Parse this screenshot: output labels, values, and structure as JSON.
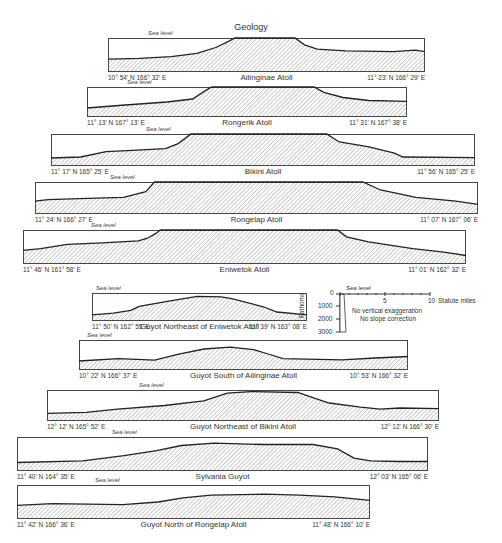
{
  "title": "Geology",
  "sea_level_label": "Sea level",
  "profiles": [
    {
      "name": "Ailinginae Atoll",
      "start": "10° 54' N 166° 32' E",
      "end": "11° 23' N 166° 29' E"
    },
    {
      "name": "Rongerik Atoll",
      "start": "11° 13' N 167° 13' E",
      "end": "11° 31' N 167° 38' E"
    },
    {
      "name": "Bikini Atoll",
      "start": "11° 17' N 165° 25' E",
      "end": "11° 56' N 165° 25' E"
    },
    {
      "name": "Rongelap Atoll",
      "start": "11° 24' N 166° 27' E",
      "end": "11° 07' N 167° 06' E"
    },
    {
      "name": "Eniwetok Atoll",
      "start": "11° 46' N 161° 58' E",
      "end": "11° 01' N 162° 32' E"
    },
    {
      "name": "Guyot Northeast of Eniwetok Atoll",
      "start": "11° 50' N 162° 55' E",
      "end": "11° 39' N 163° 08' E"
    },
    {
      "name": "Guyot South of Ailinginae Atoll",
      "start": "10° 22' N 166° 37' E",
      "end": "10° 53' N 166° 32' E"
    },
    {
      "name": "Guyot Northeast of Bikini Atoll",
      "start": "12° 12' N 165° 52' E",
      "end": "12° 12' N 166° 30' E"
    },
    {
      "name": "Sylvania Guyot",
      "start": "11° 40' N 164° 35' E",
      "end": "12° 03' N 165° 06' E"
    },
    {
      "name": "Guyot North of Rongelap Atoll",
      "start": "11° 42' N 166° 36' E",
      "end": "11° 48' N 166° 10' E"
    }
  ],
  "legend": {
    "depth_axis_label": "Fathoms",
    "depth_ticks": [
      "0",
      "1000",
      "2000",
      "3000"
    ],
    "distance_ticks": [
      "0",
      "5",
      "10"
    ],
    "distance_unit": "Statute miles",
    "note_1": "No vertical exaggeration",
    "note_2": "No slope correction"
  }
}
